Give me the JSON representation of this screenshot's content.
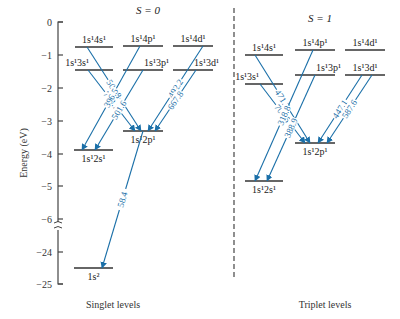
{
  "axis": {
    "label": "Energy (eV)",
    "ticks": [
      {
        "label": "0",
        "y": 22
      },
      {
        "label": "−1",
        "y": 55
      },
      {
        "label": "−2",
        "y": 88
      },
      {
        "label": "−3",
        "y": 121
      },
      {
        "label": "−4",
        "y": 154
      },
      {
        "label": "−5",
        "y": 186
      },
      {
        "label": "−6",
        "y": 219
      },
      {
        "label": "−24",
        "y": 252
      },
      {
        "label": "−25",
        "y": 284
      }
    ],
    "break_symbol": "≈"
  },
  "singlet": {
    "title": "S = 0",
    "footer": "Singlet levels",
    "levels": [
      {
        "id": "s4s",
        "label": "1s¹4s¹",
        "x1": 75,
        "x2": 113,
        "y": 47,
        "label_pos": "above"
      },
      {
        "id": "s4p",
        "label": "1s¹4p¹",
        "x1": 123,
        "x2": 163,
        "y": 46,
        "label_pos": "above"
      },
      {
        "id": "s4d",
        "label": "1s¹4d¹",
        "x1": 173,
        "x2": 213,
        "y": 46,
        "label_pos": "above"
      },
      {
        "id": "s3s",
        "label": "1s¹3s¹",
        "x1": 75,
        "x2": 113,
        "y": 70,
        "label_pos": "above-left"
      },
      {
        "id": "s3p",
        "label": "1s¹3p¹",
        "x1": 123,
        "x2": 163,
        "y": 70,
        "label_pos": "above-right"
      },
      {
        "id": "s3d",
        "label": "1s¹3d¹",
        "x1": 173,
        "x2": 213,
        "y": 70,
        "label_pos": "above-right"
      },
      {
        "id": "s2p",
        "label": "1s¹2p¹",
        "x1": 123,
        "x2": 163,
        "y": 131,
        "label_pos": "below"
      },
      {
        "id": "s2s",
        "label": "1s¹2s¹",
        "x1": 74,
        "x2": 113,
        "y": 150,
        "label_pos": "below"
      },
      {
        "id": "s1s",
        "label": "1s²",
        "x1": 74,
        "x2": 113,
        "y": 268,
        "label_pos": "below"
      }
    ],
    "transitions": [
      {
        "wavelength": "504.8",
        "from": "1s¹4s¹",
        "to": "1s¹2p¹",
        "x1": 87,
        "y1": 47,
        "x2": 141,
        "y2": 131
      },
      {
        "wavelength": "728.1",
        "from": "1s¹3s¹",
        "to": "1s¹2p¹",
        "x1": 88,
        "y1": 70,
        "x2": 135,
        "y2": 131
      },
      {
        "wavelength": "396.5",
        "from": "1s¹4p¹",
        "to": "1s¹2s¹",
        "x1": 140,
        "y1": 46,
        "x2": 82,
        "y2": 150
      },
      {
        "wavelength": "501.6",
        "from": "1s¹3p¹",
        "to": "1s¹2s¹",
        "x1": 143,
        "y1": 70,
        "x2": 95,
        "y2": 150
      },
      {
        "wavelength": "492.2",
        "from": "1s¹4d¹",
        "to": "1s¹2p¹",
        "x1": 203,
        "y1": 46,
        "x2": 148,
        "y2": 131
      },
      {
        "wavelength": "667.8",
        "from": "1s¹3d¹",
        "to": "1s¹2p¹",
        "x1": 196,
        "y1": 70,
        "x2": 155,
        "y2": 131
      },
      {
        "wavelength": "58.4",
        "from": "1s¹2p¹",
        "to": "1s²",
        "x1": 143,
        "y1": 131,
        "x2": 102,
        "y2": 268
      }
    ]
  },
  "triplet": {
    "title": "S = 1",
    "footer": "Triplet levels",
    "levels": [
      {
        "id": "t4s",
        "label": "1s¹4s¹",
        "x1": 245,
        "x2": 283,
        "y": 55,
        "label_pos": "above"
      },
      {
        "id": "t4p",
        "label": "1s¹4p¹",
        "x1": 295,
        "x2": 335,
        "y": 50,
        "label_pos": "above"
      },
      {
        "id": "t4d",
        "label": "1s¹4d¹",
        "x1": 345,
        "x2": 385,
        "y": 50,
        "label_pos": "above"
      },
      {
        "id": "t3s",
        "label": "1s¹3s¹",
        "x1": 245,
        "x2": 283,
        "y": 84,
        "label_pos": "above-left"
      },
      {
        "id": "t3p",
        "label": "1s¹3p¹",
        "x1": 295,
        "x2": 335,
        "y": 75,
        "label_pos": "above-right"
      },
      {
        "id": "t3d",
        "label": "1s¹3d¹",
        "x1": 345,
        "x2": 385,
        "y": 75,
        "label_pos": "above"
      },
      {
        "id": "t2p",
        "label": "1s¹2p¹",
        "x1": 295,
        "x2": 335,
        "y": 143,
        "label_pos": "below"
      },
      {
        "id": "t2s",
        "label": "1s¹2s¹",
        "x1": 245,
        "x2": 283,
        "y": 181,
        "label_pos": "below"
      }
    ],
    "transitions": [
      {
        "wavelength": "471.3",
        "from": "1s¹4s¹",
        "to": "1s¹2p¹",
        "x1": 255,
        "y1": 55,
        "x2": 310,
        "y2": 143
      },
      {
        "wavelength": "706.5",
        "from": "1s¹3s¹",
        "to": "1s¹2p¹",
        "x1": 260,
        "y1": 84,
        "x2": 305,
        "y2": 143
      },
      {
        "wavelength": "318.8",
        "from": "1s¹4p¹",
        "to": "1s¹2s¹",
        "x1": 313,
        "y1": 50,
        "x2": 255,
        "y2": 181
      },
      {
        "wavelength": "388.9",
        "from": "1s¹3p¹",
        "to": "1s¹2s¹",
        "x1": 315,
        "y1": 75,
        "x2": 267,
        "y2": 181
      },
      {
        "wavelength": "447.1",
        "from": "1s¹4d¹",
        "to": "1s¹2p¹",
        "x1": 362,
        "y1": 75,
        "x2": 318,
        "y2": 143
      },
      {
        "wavelength": "587.6",
        "from": "1s¹3d¹",
        "to": "1s¹2p¹",
        "x1": 372,
        "y1": 75,
        "x2": 327,
        "y2": 143
      }
    ]
  }
}
